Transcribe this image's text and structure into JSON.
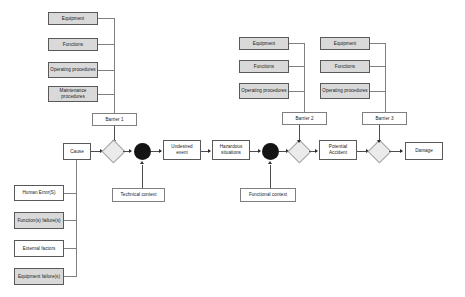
{
  "diagram": {
    "colors": {
      "shaded_fill": "#d9d9d9",
      "plain_fill": "#ffffff",
      "box_border": "#595959",
      "diamond_fill": "#ebebeb",
      "diamond_border": "#a6a6a6",
      "circle_fill": "#141414",
      "connector": "#808080"
    },
    "left_barrier_group": {
      "items": [
        {
          "label": "Equipment",
          "shaded": true
        },
        {
          "label": "Functions",
          "shaded": true
        },
        {
          "label": "Operating procedures",
          "shaded": true
        },
        {
          "label": "Maintenance procedures",
          "shaded": true
        }
      ]
    },
    "middle_barrier_group": {
      "items": [
        {
          "label": "Equipment",
          "shaded": true
        },
        {
          "label": "Functions",
          "shaded": true
        },
        {
          "label": "Operating procedures",
          "shaded": true
        }
      ]
    },
    "right_barrier_group": {
      "items": [
        {
          "label": "Equipment",
          "shaded": true
        },
        {
          "label": "Functions",
          "shaded": true
        },
        {
          "label": "Operating procedures",
          "shaded": true
        }
      ]
    },
    "barriers": [
      {
        "label": "Barrier 1"
      },
      {
        "label": "Barrier 2"
      },
      {
        "label": "Barrier 3"
      }
    ],
    "causes": {
      "items": [
        {
          "label": "Human Error(S)",
          "shaded": false
        },
        {
          "label": "Function(s) failure(s)",
          "shaded": true
        },
        {
          "label": "External factors",
          "shaded": false
        },
        {
          "label": "Equipment failure(s)",
          "shaded": true
        }
      ]
    },
    "flow": {
      "cause": "Cause",
      "undesired_event": "Undesired event",
      "hazardous_situations": "Hazardous situations",
      "potential_accident": "Potential Accident",
      "damage": "Damage"
    },
    "contexts": {
      "technical": "Technical context",
      "functional": "Functional context"
    }
  }
}
